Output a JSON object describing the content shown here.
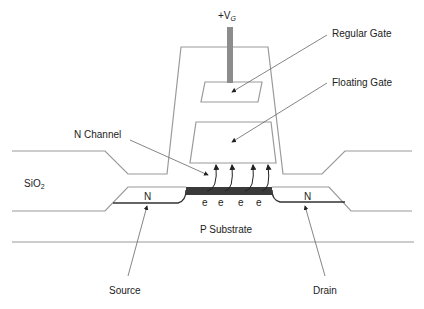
{
  "diagram": {
    "type": "floating-gate-transistor-cross-section",
    "labels": {
      "gate_voltage_prefix": "+V",
      "gate_voltage_sub": "G",
      "regular_gate": "Regular Gate",
      "floating_gate": "Floating Gate",
      "n_channel": "N Channel",
      "oxide": "SiO",
      "oxide_sub": "2",
      "source_region": "N",
      "drain_region": "N",
      "substrate": "P Substrate",
      "source": "Source",
      "drain": "Drain",
      "electrons": [
        "e",
        "e",
        "e",
        "e"
      ]
    },
    "colors": {
      "outline": "#9a9a9a",
      "gate_lead": "#8c8c8c",
      "channel": "#3a3a3a",
      "text": "#222222",
      "arrow": "#222222"
    }
  }
}
